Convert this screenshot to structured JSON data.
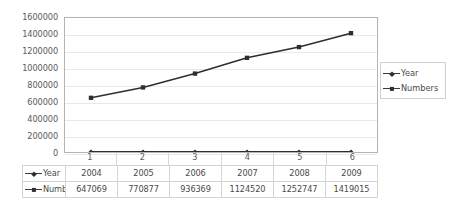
{
  "chart_data": {
    "type": "line",
    "title": "",
    "subtitle": "",
    "xlabel": "",
    "ylabel": "",
    "categories": [
      "1",
      "2",
      "3",
      "4",
      "5",
      "6"
    ],
    "series": [
      {
        "name": "Year",
        "marker": "diamond",
        "color": "#2e2e2e",
        "values": [
          2004,
          2005,
          2006,
          2007,
          2008,
          2009
        ]
      },
      {
        "name": "Numbers",
        "marker": "square",
        "color": "#2e2e2e",
        "values": [
          647069,
          770877,
          936369,
          1124520,
          1252747,
          1419015
        ]
      }
    ],
    "ylim": [
      0,
      1600000
    ],
    "ytick_step": 200000,
    "ytick_labels": [
      "1600000",
      "1400000",
      "1200000",
      "1000000",
      "800000",
      "600000",
      "400000",
      "200000",
      "0"
    ],
    "grid": true,
    "legend_position": "right",
    "has_data_table": true
  },
  "legend": {
    "entries": [
      {
        "label": "Year"
      },
      {
        "label": "Numbers"
      }
    ]
  },
  "data_table": {
    "rows": [
      {
        "header": "Year",
        "cells": [
          "2004",
          "2005",
          "2006",
          "2007",
          "2008",
          "2009"
        ]
      },
      {
        "header": "Numbers",
        "cells": [
          "647069",
          "770877",
          "936369",
          "1124520",
          "1252747",
          "1419015"
        ]
      }
    ]
  },
  "colors": {
    "series_line": "#2e2e2e",
    "gridline": "#e9e9e9",
    "plot_border": "#b4b4b4",
    "table_border": "#d4d4d4",
    "text": "#4a4a4a"
  }
}
